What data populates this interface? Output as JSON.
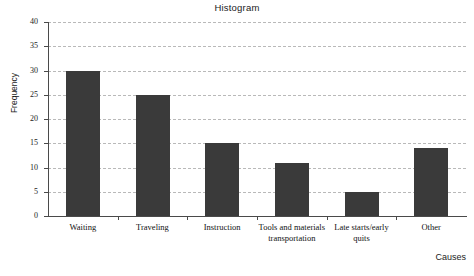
{
  "chart_data": {
    "type": "bar",
    "title": "Histogram",
    "xlabel": "Causes",
    "ylabel": "Frequency",
    "categories": [
      "Waiting",
      "Traveling",
      "Instruction",
      "Tools and materials transportation",
      "Late starts/early quits",
      "Other"
    ],
    "values": [
      30,
      25,
      15,
      11,
      5,
      14
    ],
    "ylim": [
      0,
      40
    ],
    "ytick_labels": [
      "0",
      "5",
      "10",
      "15",
      "20",
      "25",
      "30",
      "35",
      "40"
    ],
    "ytick_values": [
      0,
      5,
      10,
      15,
      20,
      25,
      30,
      35,
      40
    ],
    "grid": "horizontal-dashed",
    "legend": "none",
    "bar_color": "#3a3a3a",
    "grid_color": "#b9b9b9",
    "axis_color": "#4a4a4a",
    "background_color": "#ffffff"
  }
}
